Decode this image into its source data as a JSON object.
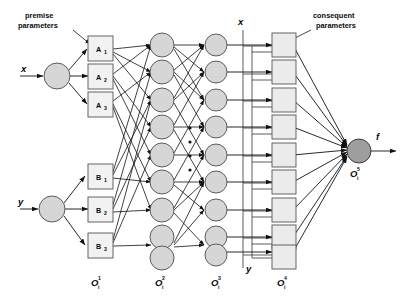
{
  "figure": {
    "annotations": {
      "premise_parameters": "premise\nparameters",
      "premise_parameters_line1": "premise",
      "premise_parameters_line2": "parameters",
      "consequent_parameters_line1": "consequent",
      "consequent_parameters_line2": "parameters"
    },
    "inputs": [
      {
        "name": "input-x",
        "label": "x"
      },
      {
        "name": "input-y",
        "label": "y"
      }
    ],
    "bus_labels": {
      "top": "x",
      "bottom": "y"
    },
    "output": {
      "label": "f",
      "node_label_base": "O",
      "node_label_sub": "i",
      "node_label_sup": "5"
    },
    "membership_nodes": [
      {
        "base": "A",
        "sub": "1"
      },
      {
        "base": "A",
        "sub": "2"
      },
      {
        "base": "A",
        "sub": "3"
      },
      {
        "base": "B",
        "sub": "1"
      },
      {
        "base": "B",
        "sub": "2"
      },
      {
        "base": "B",
        "sub": "3"
      }
    ],
    "layer_labels": [
      {
        "base": "O",
        "sub": "i",
        "sup": "1"
      },
      {
        "base": "O",
        "sub": "i",
        "sup": "2"
      },
      {
        "base": "O",
        "sub": "i",
        "sup": "3"
      },
      {
        "base": "O",
        "sub": "i",
        "sup": "4"
      }
    ],
    "layer_node_counts": {
      "layer1_membership": 6,
      "layer2_rules": 9,
      "layer3_norm": 9,
      "layer4_consequent": 9,
      "layer5_output": 1
    },
    "colors": {
      "node_fill": "#d6d6d6",
      "node_stroke": "#4d4d4d",
      "square_fill": "#ebebeb",
      "output_fill": "#9e9e9e",
      "edge": "#111111",
      "background": "#ffffff",
      "text": "#0a0a0a"
    },
    "ellipsis": {
      "count": 4,
      "glyph": "."
    }
  }
}
